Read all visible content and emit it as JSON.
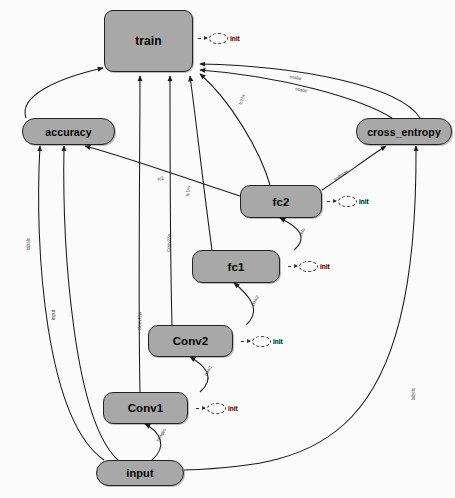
{
  "diagram": {
    "kind": "tensorflow-computation-graph",
    "background": "#fbfbfb",
    "node_fill": "#a8a8a8",
    "node_stroke": "#222222",
    "edge_color": "#1a1a1a"
  },
  "nodes": [
    {
      "id": "train",
      "label": "train",
      "x": 104,
      "y": 10,
      "w": 89,
      "h": 62,
      "shape": "rounded-rect",
      "font": 12
    },
    {
      "id": "accuracy",
      "label": "accuracy",
      "x": 22,
      "y": 118,
      "w": 93,
      "h": 27,
      "shape": "pill",
      "font": 10.5
    },
    {
      "id": "cross_entropy",
      "label": "cross_entropy",
      "x": 356,
      "y": 118,
      "w": 96,
      "h": 27,
      "shape": "pill",
      "font": 10.5
    },
    {
      "id": "fc2",
      "label": "fc2",
      "x": 240,
      "y": 185,
      "w": 82,
      "h": 33,
      "shape": "soft",
      "font": 11.5
    },
    {
      "id": "fc1",
      "label": "fc1",
      "x": 192,
      "y": 250,
      "w": 88,
      "h": 33,
      "shape": "soft",
      "font": 11.5
    },
    {
      "id": "Conv2",
      "label": "Conv2",
      "x": 148,
      "y": 325,
      "w": 85,
      "h": 32,
      "shape": "soft",
      "font": 11.5
    },
    {
      "id": "Conv1",
      "label": "Conv1",
      "x": 103,
      "y": 392,
      "w": 85,
      "h": 32,
      "shape": "soft",
      "font": 11.5
    },
    {
      "id": "input",
      "label": "input",
      "x": 96,
      "y": 460,
      "w": 88,
      "h": 26,
      "shape": "pill",
      "font": 11
    }
  ],
  "init_nodes": [
    {
      "id": "init-train",
      "label": "init",
      "x": 198,
      "y": 33
    },
    {
      "id": "init-fc2",
      "label": "init",
      "x": 327,
      "y": 196
    },
    {
      "id": "init-fc1",
      "label": "init",
      "x": 288,
      "y": 261
    },
    {
      "id": "init-conv2",
      "label": "init",
      "x": 241,
      "y": 336
    },
    {
      "id": "init-conv1",
      "label": "init",
      "x": 196,
      "y": 403
    }
  ],
  "edges": [
    {
      "id": "e-accuracy-train",
      "from": "accuracy",
      "to": "train",
      "label": "",
      "path": "M 26 118 C 18 96 58 78 103 68"
    },
    {
      "id": "e-conv1-train",
      "from": "Conv1",
      "to": "train",
      "label": "Conv1/w",
      "path": "M 140 392 C 138 300 140 150 140 76"
    },
    {
      "id": "e-conv2-train",
      "from": "Conv2",
      "to": "train",
      "label": "Conv2/w",
      "path": "M 172 325 C 170 250 170 150 170 76"
    },
    {
      "id": "e-fc1-train",
      "from": "fc1",
      "to": "train",
      "label": "fc1/w",
      "path": "M 212 250 C 205 200 196 120 190 76"
    },
    {
      "id": "e-fc2-train",
      "from": "fc2",
      "to": "train",
      "label": "fc2/w",
      "path": "M 270 185 C 260 150 230 100 200 74"
    },
    {
      "id": "e-ce-train-a",
      "from": "cross_entropy",
      "to": "train",
      "label": "scalar",
      "path": "M 392 118 C 360 98 280 76 200 70"
    },
    {
      "id": "e-ce-train-b",
      "from": "cross_entropy",
      "to": "train",
      "label": "scalar",
      "path": "M 420 118 C 400 86 300 66 200 64"
    },
    {
      "id": "e-fc2-ce",
      "from": "fc2",
      "to": "cross_entropy",
      "label": "softmax",
      "path": "M 322 190 C 345 175 370 156 386 146"
    },
    {
      "id": "e-fc2-accuracy",
      "from": "fc2",
      "to": "accuracy",
      "label": "fc2",
      "path": "M 240 196 C 190 180 130 158 85 146"
    },
    {
      "id": "e-input-accuracy",
      "from": "input",
      "to": "accuracy",
      "label": "labels",
      "path": "M 104 460 C 46 420 34 250 40 146"
    },
    {
      "id": "e-input-accuracy2",
      "from": "input",
      "to": "accuracy",
      "label": "input",
      "path": "M 118 460 C 74 420 62 250 64 146"
    },
    {
      "id": "e-input-ce",
      "from": "input",
      "to": "cross_entropy",
      "label": "labels",
      "path": "M 184 470 C 320 466 418 440 416 146"
    },
    {
      "id": "e-input-conv1",
      "from": "input",
      "to": "Conv1",
      "label": "images",
      "path": "M 152 460 C 168 446 160 432 145 424"
    },
    {
      "id": "e-conv1-conv2",
      "from": "Conv1",
      "to": "Conv2",
      "label": "pool1",
      "path": "M 200 392 C 216 378 206 366 190 357"
    },
    {
      "id": "e-conv2-fc1",
      "from": "Conv2",
      "to": "fc1",
      "label": "pool2",
      "path": "M 246 325 C 262 310 250 296 234 283"
    },
    {
      "id": "e-fc1-fc2",
      "from": "fc1",
      "to": "fc2",
      "label": "relu",
      "path": "M 294 250 C 310 236 296 226 280 218"
    }
  ],
  "edge_labels": [
    {
      "id": "lbl-fc2-train",
      "text": "fc2/w",
      "x": 238,
      "y": 104,
      "rot": -74
    },
    {
      "id": "lbl-ce-train-a",
      "text": "scalar",
      "x": 296,
      "y": 86,
      "rot": 13
    },
    {
      "id": "lbl-ce-train-b",
      "text": "scalar",
      "x": 290,
      "y": 74,
      "rot": 11
    },
    {
      "id": "lbl-fc2-acc",
      "text": "fc2",
      "x": 157,
      "y": 177,
      "rot": -14
    },
    {
      "id": "lbl-fc1-train",
      "text": "fc1/w",
      "x": 185,
      "y": 196,
      "rot": -84
    },
    {
      "id": "lbl-conv2-train",
      "text": "Conv2/w",
      "x": 166,
      "y": 252,
      "rot": -88
    },
    {
      "id": "lbl-conv1-train",
      "text": "Conv1/w",
      "x": 137,
      "y": 330,
      "rot": -88
    },
    {
      "id": "lbl-fc2-ce",
      "text": "softmax",
      "x": 333,
      "y": 178,
      "rot": -36
    },
    {
      "id": "lbl-fc1-fc2",
      "text": "relu",
      "x": 298,
      "y": 234,
      "rot": -62
    },
    {
      "id": "lbl-conv2-fc1",
      "text": "pool2",
      "x": 250,
      "y": 304,
      "rot": -58
    },
    {
      "id": "lbl-conv1-conv2",
      "text": "pool1",
      "x": 203,
      "y": 374,
      "rot": -58
    },
    {
      "id": "lbl-input-conv1",
      "text": "images",
      "x": 155,
      "y": 440,
      "rot": -58
    },
    {
      "id": "lbl-input-acc1",
      "text": "labels",
      "x": 26,
      "y": 250,
      "rot": -90
    },
    {
      "id": "lbl-input-acc2",
      "text": "input",
      "x": 51,
      "y": 320,
      "rot": -90
    },
    {
      "id": "lbl-input-ce",
      "text": "labels",
      "x": 411,
      "y": 400,
      "rot": -90
    }
  ]
}
